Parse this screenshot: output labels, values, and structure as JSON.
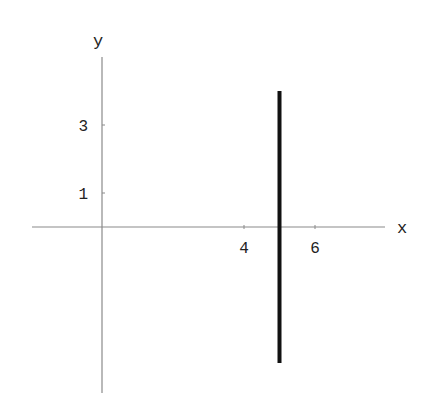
{
  "chart_data": {
    "type": "line",
    "title": "",
    "xlabel": "x",
    "ylabel": "y",
    "xlim": [
      -2,
      8
    ],
    "ylim": [
      -5,
      5
    ],
    "grid": false,
    "legend": null,
    "x_ticks": [
      4,
      6
    ],
    "y_ticks": [
      1,
      3
    ],
    "x_tick_labels": [
      "4",
      "6"
    ],
    "y_tick_labels": [
      "1",
      "3"
    ],
    "series": [
      {
        "name": "vertical line x = 5",
        "x": [
          5,
          5
        ],
        "y": [
          -4,
          4
        ],
        "color": "#111111",
        "line_width": "thick"
      }
    ]
  },
  "colors": {
    "axis": "#8a8a8a",
    "line": "#111111",
    "text": "#222222"
  }
}
